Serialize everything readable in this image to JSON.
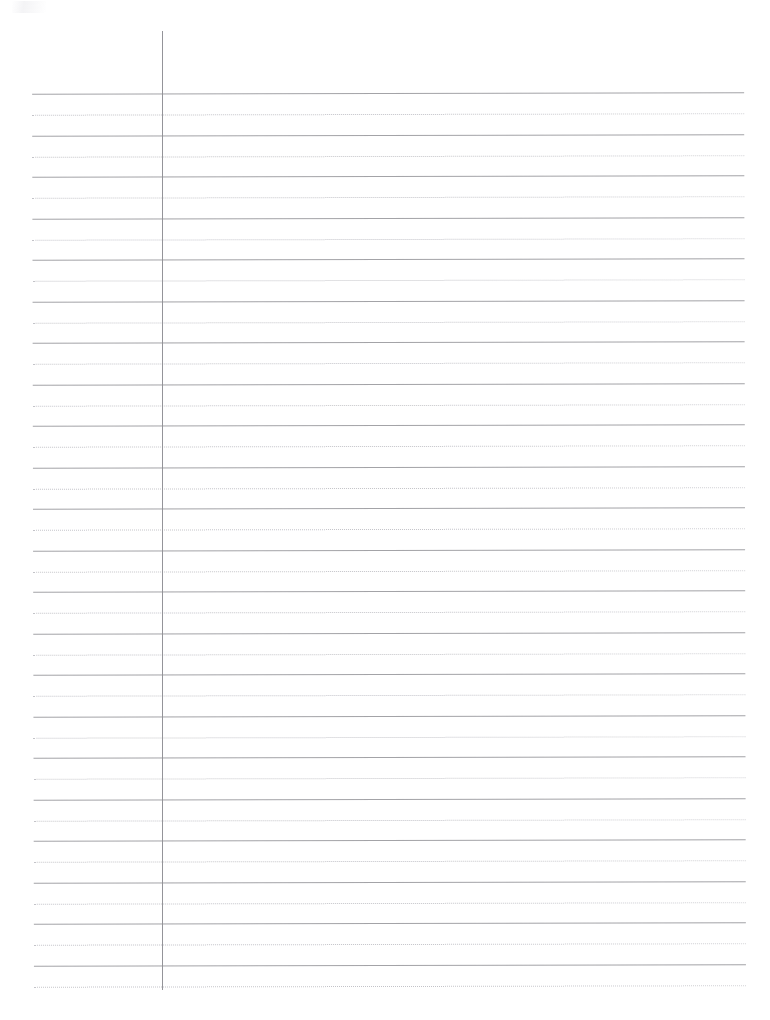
{
  "document": {
    "kind": "ruled-notebook-paper-scan",
    "page_label": "",
    "background_color": "#ffffff",
    "width_px": 770,
    "height_px": 1020
  },
  "ruling": {
    "solid_line_color": "#9b9ba0",
    "dotted_line_color": "#b9b9bf",
    "line_left_px": 33,
    "line_right_px": 745,
    "first_solid_y_px": 93,
    "line_pitch_px": 41.5,
    "dotted_offset_px": 21,
    "solid_line_count": 22,
    "dotted_line_count": 22,
    "skew_degrees": -0.12
  },
  "margin_rule": {
    "color": "#8e8e94",
    "x_px": 162,
    "top_y_px": 31,
    "bottom_y_px": 990
  },
  "artifact": {
    "label": "scanner-smudge",
    "x_px": 12,
    "y_px": 1
  },
  "content": {
    "written_text": "",
    "note": ""
  }
}
